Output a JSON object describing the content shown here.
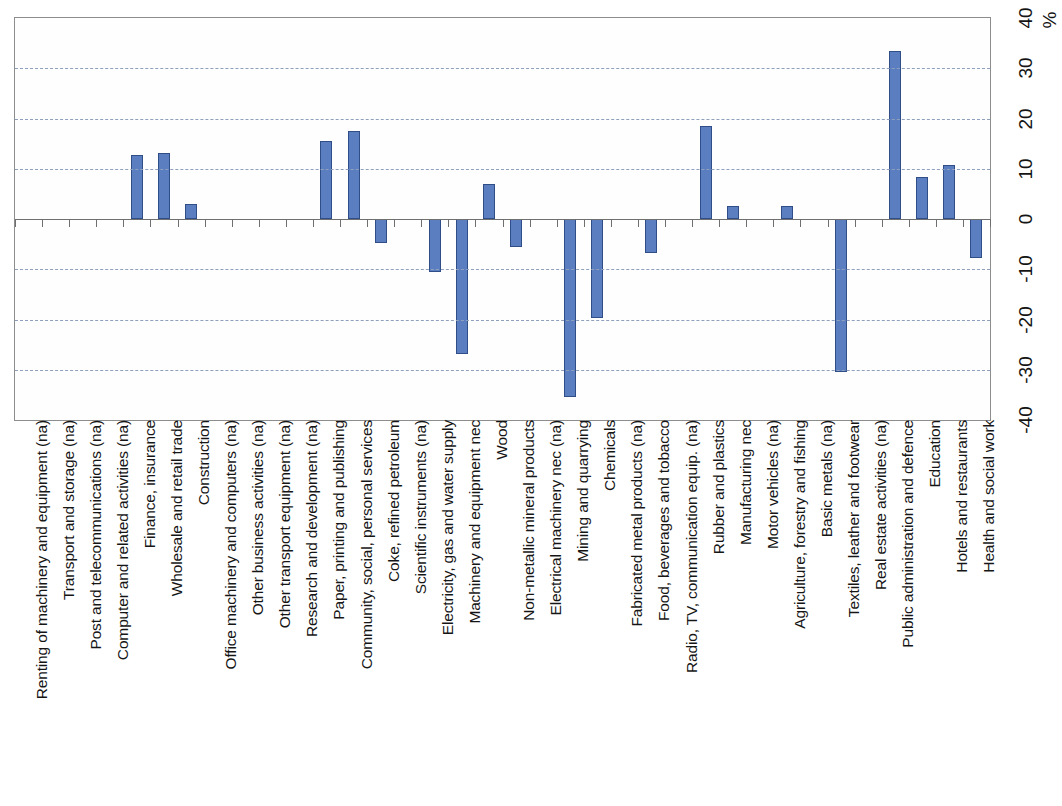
{
  "chart_data": {
    "type": "bar",
    "title": "",
    "xlabel": "",
    "ylabel": "%",
    "unit_label": "%",
    "ylim": [
      -40,
      40
    ],
    "ytick_labels": [
      "40",
      "30",
      "20",
      "10",
      "0",
      "-10",
      "-20",
      "-30",
      "-40"
    ],
    "yticks": [
      40,
      30,
      20,
      10,
      0,
      -10,
      -20,
      -30,
      -40
    ],
    "grid": true,
    "gridlines": [
      30,
      20,
      10,
      -10,
      -20,
      -30
    ],
    "legend": null,
    "bar_color": "#5b7ec1",
    "bar_border_color": "#2f4d86",
    "categories": [
      "Renting of machinery and equipment (na)",
      "Transport and storage (na)",
      "Post and telecommunications (na)",
      "Computer and related activities (na)",
      "Finance, insurance",
      "Wholesale and retail trade",
      "Construction",
      "Office machinery and computers (na)",
      "Other business activities (na)",
      "Other transport equipment (na)",
      "Research and development (na)",
      "Paper, printing and publishing",
      "Community, social, personal services",
      "Coke, refined petroleum",
      "Scientific instruments (na)",
      "Electricity, gas and water supply",
      "Machinery and equipment nec",
      "Wood",
      "Non-metallic mineral products",
      "Electrical machinery nec (na)",
      "Mining and quarrying",
      "Chemicals",
      "Fabricated metal products (na)",
      "Food, beverages and tobacco",
      "Radio, TV, communication equip. (na)",
      "Rubber and plastics",
      "Manufacturing nec",
      "Motor vehicles (na)",
      "Agriculture, forestry and fishing",
      "Basic metals (na)",
      "Textiles, leather and footwear",
      "Real estate activities (na)",
      "Public administration and defence",
      "Education",
      "Hotels and restaurants",
      "Health and social work"
    ],
    "values": [
      null,
      null,
      null,
      null,
      12.7,
      13.2,
      3.0,
      null,
      null,
      null,
      null,
      15.6,
      17.5,
      -4.7,
      null,
      -10.6,
      -26.8,
      7.0,
      -5.5,
      null,
      -35.5,
      -19.7,
      null,
      -6.8,
      null,
      18.6,
      2.5,
      null,
      2.5,
      null,
      -30.5,
      null,
      33.4,
      8.4,
      10.7,
      -7.8
    ]
  }
}
